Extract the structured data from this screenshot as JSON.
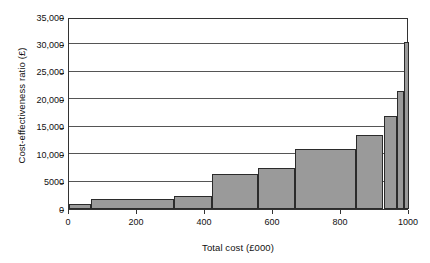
{
  "chart_data": {
    "type": "bar",
    "title": "",
    "xlabel": "Total cost (£000)",
    "ylabel": "Cost-effectiveness ratio (£)",
    "xlim": [
      0,
      1000
    ],
    "ylim": [
      0,
      35000
    ],
    "grid": true,
    "legend": "none",
    "note": "Histogram / step-plot: contiguous bars of unequal width spanning the full x range",
    "xticks": [
      0,
      200,
      400,
      600,
      800,
      1000
    ],
    "xtick_labels": [
      "0",
      "200",
      "400",
      "600",
      "800",
      "1000"
    ],
    "yticks": [
      0,
      5000,
      10000,
      15000,
      20000,
      25000,
      30000,
      35000
    ],
    "ytick_labels": [
      "0",
      "5000",
      "10,000",
      "15,000",
      "20,000",
      "25,000",
      "30,000",
      "35,000"
    ],
    "bin_edges": [
      0,
      65,
      310,
      420,
      555,
      665,
      845,
      925,
      965,
      985,
      1000
    ],
    "values": [
      1000,
      1800,
      2300,
      6400,
      7500,
      10900,
      13500,
      17000,
      21600,
      30500
    ],
    "bars": [
      {
        "x0": 0,
        "x1": 65,
        "value": 1000
      },
      {
        "x0": 65,
        "x1": 310,
        "value": 1800
      },
      {
        "x0": 310,
        "x1": 420,
        "value": 2300
      },
      {
        "x0": 420,
        "x1": 555,
        "value": 6400
      },
      {
        "x0": 555,
        "x1": 665,
        "value": 7500
      },
      {
        "x0": 665,
        "x1": 845,
        "value": 10900
      },
      {
        "x0": 845,
        "x1": 925,
        "value": 13500
      },
      {
        "x0": 925,
        "x1": 965,
        "value": 17000
      },
      {
        "x0": 965,
        "x1": 985,
        "value": 21600
      },
      {
        "x0": 985,
        "x1": 1000,
        "value": 30500
      }
    ],
    "colors": {
      "bar_fill": "#9a9a9a",
      "bar_edge": "#2b2b2b",
      "grid": "#555555",
      "frame": "#333333",
      "background": "#ffffff",
      "text": "#111111"
    }
  }
}
